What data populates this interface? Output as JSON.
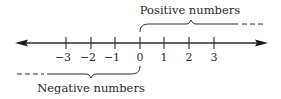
{
  "diagram": {
    "type": "number-line",
    "colors": {
      "line": "#2a2a2a",
      "text": "#2a2a2a",
      "background": "#ffffff"
    },
    "axis": {
      "ticks": [
        {
          "value": -3,
          "label": "−3"
        },
        {
          "value": -2,
          "label": "−2"
        },
        {
          "value": -1,
          "label": "−1"
        },
        {
          "value": 0,
          "label": "0"
        },
        {
          "value": 1,
          "label": "1"
        },
        {
          "value": 2,
          "label": "2"
        },
        {
          "value": 3,
          "label": "3"
        }
      ],
      "arrows": [
        "left-arrow",
        "right-arrow"
      ]
    },
    "annotations": {
      "positive": {
        "label": "Positive numbers",
        "side": "top",
        "direction": "right"
      },
      "negative": {
        "label": "Negative numbers",
        "side": "bottom",
        "direction": "left"
      }
    }
  }
}
